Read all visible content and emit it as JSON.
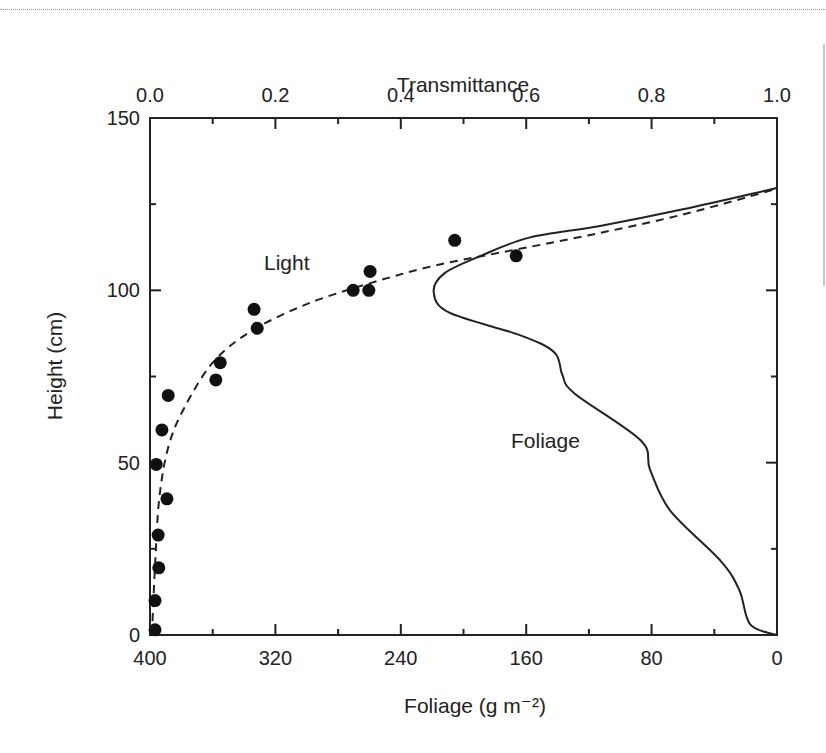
{
  "chart_data": {
    "type": "scatter",
    "title": "",
    "top_axis": {
      "label": "Transmittance",
      "ticks": [
        "0.0",
        "0.2",
        "0.4",
        "0.6",
        "0.8",
        "1.0"
      ],
      "range": [
        0.0,
        1.0
      ]
    },
    "bottom_axis": {
      "label": "Foliage (g m⁻²)",
      "ticks": [
        "400",
        "320",
        "240",
        "160",
        "80",
        "0"
      ],
      "range": [
        400,
        0
      ]
    },
    "left_axis": {
      "label": "Height (cm)",
      "ticks": [
        "0",
        "50",
        "100",
        "150"
      ],
      "range": [
        0,
        150
      ]
    },
    "grid": false,
    "annotations": [
      {
        "text": "Light",
        "near_series": "Light transmittance"
      },
      {
        "text": "Foliage",
        "near_series": "Foliage density"
      }
    ],
    "series": [
      {
        "name": "Light transmittance (observed)",
        "kind": "points",
        "axis": "top",
        "points": [
          {
            "transmittance": 0.008,
            "height": 1.5
          },
          {
            "transmittance": 0.008,
            "height": 10
          },
          {
            "transmittance": 0.014,
            "height": 19.5
          },
          {
            "transmittance": 0.013,
            "height": 29
          },
          {
            "transmittance": 0.027,
            "height": 39.5
          },
          {
            "transmittance": 0.01,
            "height": 49.5
          },
          {
            "transmittance": 0.019,
            "height": 59.5
          },
          {
            "transmittance": 0.029,
            "height": 69.5
          },
          {
            "transmittance": 0.105,
            "height": 74
          },
          {
            "transmittance": 0.112,
            "height": 79
          },
          {
            "transmittance": 0.171,
            "height": 89
          },
          {
            "transmittance": 0.166,
            "height": 94.5
          },
          {
            "transmittance": 0.324,
            "height": 100
          },
          {
            "transmittance": 0.349,
            "height": 100
          },
          {
            "transmittance": 0.351,
            "height": 105.5
          },
          {
            "transmittance": 0.486,
            "height": 114.5
          },
          {
            "transmittance": 0.584,
            "height": 110
          }
        ]
      },
      {
        "name": "Light transmittance (fitted)",
        "kind": "dashed-line",
        "axis": "top",
        "points": [
          {
            "transmittance": 0.003,
            "height": 0
          },
          {
            "transmittance": 0.008,
            "height": 20
          },
          {
            "transmittance": 0.015,
            "height": 40
          },
          {
            "transmittance": 0.03,
            "height": 55
          },
          {
            "transmittance": 0.055,
            "height": 66
          },
          {
            "transmittance": 0.1,
            "height": 79
          },
          {
            "transmittance": 0.16,
            "height": 88
          },
          {
            "transmittance": 0.25,
            "height": 96
          },
          {
            "transmittance": 0.35,
            "height": 102
          },
          {
            "transmittance": 0.45,
            "height": 107
          },
          {
            "transmittance": 0.56,
            "height": 111
          },
          {
            "transmittance": 0.7,
            "height": 116
          },
          {
            "transmittance": 0.85,
            "height": 122
          },
          {
            "transmittance": 1.0,
            "height": 129.5
          }
        ]
      },
      {
        "name": "Foliage density",
        "kind": "solid-line",
        "axis": "bottom",
        "points": [
          {
            "foliage": 0,
            "height": 129.7
          },
          {
            "foliage": 60,
            "height": 123.5
          },
          {
            "foliage": 113,
            "height": 118.7
          },
          {
            "foliage": 158,
            "height": 115.3
          },
          {
            "foliage": 189,
            "height": 110
          },
          {
            "foliage": 212,
            "height": 105
          },
          {
            "foliage": 219,
            "height": 99.5
          },
          {
            "foliage": 209,
            "height": 93.5
          },
          {
            "foliage": 164,
            "height": 87
          },
          {
            "foliage": 142,
            "height": 82
          },
          {
            "foliage": 137,
            "height": 75.5
          },
          {
            "foliage": 129,
            "height": 70
          },
          {
            "foliage": 87,
            "height": 56.5
          },
          {
            "foliage": 81,
            "height": 48
          },
          {
            "foliage": 68,
            "height": 36
          },
          {
            "foliage": 36,
            "height": 21.5
          },
          {
            "foliage": 24,
            "height": 13
          },
          {
            "foliage": 17,
            "height": 3
          },
          {
            "foliage": 0,
            "height": 0
          }
        ]
      }
    ]
  }
}
